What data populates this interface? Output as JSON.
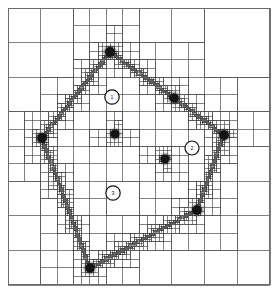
{
  "figure": {
    "type": "amr-quadtree-mesh",
    "title": "",
    "caption": "",
    "width": 278,
    "height": 293,
    "background_color": "#ffffff",
    "grid_line_color": "#4a4a4a",
    "particle_color": "#141414",
    "marker_outline_color": "#111111"
  },
  "domain": {
    "name": "simulation-domain",
    "x": 8,
    "y": 8,
    "width": 262,
    "height": 277
  },
  "particles": [
    {
      "id": "p1",
      "label": "",
      "cx": 110,
      "cy": 52,
      "r": 6.0,
      "blur": 2.6
    },
    {
      "id": "p2",
      "label": "",
      "cx": 174,
      "cy": 98,
      "r": 5.6,
      "blur": 2.8
    },
    {
      "id": "p3",
      "label": "",
      "cx": 42,
      "cy": 138,
      "r": 5.8,
      "blur": 3.2
    },
    {
      "id": "p4",
      "label": "",
      "cx": 115,
      "cy": 134,
      "r": 5.2,
      "blur": 1.6
    },
    {
      "id": "p5",
      "label": "",
      "cx": 224,
      "cy": 135,
      "r": 5.8,
      "blur": 3.0
    },
    {
      "id": "p6",
      "label": "",
      "cx": 165,
      "cy": 159,
      "r": 5.4,
      "blur": 2.2
    },
    {
      "id": "p7",
      "label": "",
      "cx": 197,
      "cy": 210,
      "r": 5.8,
      "blur": 2.8
    },
    {
      "id": "p8",
      "label": "",
      "cx": 90,
      "cy": 268,
      "r": 5.6,
      "blur": 3.4
    }
  ],
  "markers": [
    {
      "id": "m1",
      "label": "1",
      "cx": 112,
      "cy": 97,
      "r": 7.2
    },
    {
      "id": "m2",
      "label": "2",
      "cx": 192,
      "cy": 148,
      "r": 7.0
    },
    {
      "id": "m3",
      "label": "3",
      "cx": 113,
      "cy": 193,
      "r": 7.2
    }
  ],
  "chart_data": {
    "type": "diagram",
    "subtype": "adaptive-mesh-refinement-quadtree",
    "root_cells_per_side": 4,
    "max_refinement_level": 6,
    "refinement_seeds": [
      [
        110,
        52
      ],
      [
        174,
        98
      ],
      [
        42,
        138
      ],
      [
        115,
        134
      ],
      [
        224,
        135
      ],
      [
        165,
        159
      ],
      [
        197,
        210
      ],
      [
        90,
        268
      ]
    ],
    "annotation_markers": [
      {
        "label": "1",
        "position": [
          112,
          97
        ]
      },
      {
        "label": "2",
        "position": [
          192,
          148
        ]
      },
      {
        "label": "3",
        "position": [
          113,
          193
        ]
      }
    ],
    "xlabel": "",
    "ylabel": "",
    "xlim": [
      8,
      270
    ],
    "ylim": [
      8,
      285
    ],
    "grid": true,
    "legend": false
  }
}
